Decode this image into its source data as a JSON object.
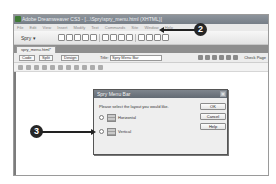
{
  "window": {
    "title": "Adobe Dreamweaver CS3 - [...\\Spry\\spry_menu.html (XHTML)]",
    "menu": [
      "File",
      "Edit",
      "View",
      "Insert",
      "Modify",
      "Text",
      "Commands",
      "Site",
      "Window",
      "Help"
    ],
    "insert_category": "Spry ▾"
  },
  "document": {
    "tab_label": "spry_menu.html*",
    "view_buttons": {
      "code": "Code",
      "split": "Split",
      "design": "Design"
    },
    "title_label": "Title:",
    "title_value": "Spry Menu Bar",
    "check_page": "Check Page"
  },
  "dialog": {
    "title": "Spry Menu Bar",
    "close_glyph": "×",
    "prompt": "Please select the layout you would like.",
    "options": [
      {
        "label": "Horizontal",
        "selected": false
      },
      {
        "label": "Vertical",
        "selected": true
      }
    ],
    "buttons": {
      "ok": "OK",
      "cancel": "Cancel",
      "help": "Help"
    }
  },
  "callouts": {
    "step2": "2",
    "step3": "3"
  },
  "colors": {
    "callout_bg": "#262626",
    "titlebar": "#767e87",
    "dialog_bg": "#eeeeee"
  }
}
